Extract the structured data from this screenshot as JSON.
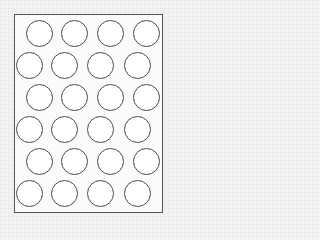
{
  "figure": {
    "sheet": {
      "x": 14,
      "y": 14,
      "width": 149,
      "height": 199,
      "border_color": "#555555"
    },
    "circle": {
      "diameter": 27,
      "stroke_color": "#4a4a4a",
      "fill": "#ffffff"
    },
    "rows": [
      {
        "y": 33,
        "x": [
          39,
          74,
          110,
          146
        ]
      },
      {
        "y": 65,
        "x": [
          29,
          64,
          100,
          137
        ]
      },
      {
        "y": 97,
        "x": [
          39,
          74,
          110,
          146
        ]
      },
      {
        "y": 129,
        "x": [
          29,
          64,
          100,
          137
        ]
      },
      {
        "y": 161,
        "x": [
          39,
          74,
          110,
          146
        ]
      },
      {
        "y": 193,
        "x": [
          29,
          64,
          100,
          137
        ]
      }
    ],
    "total_circles": 24
  }
}
